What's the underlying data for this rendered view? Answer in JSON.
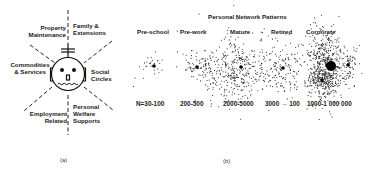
{
  "panel_a": {
    "caption": "(a)",
    "sectors": {
      "property": "Property Maintenance",
      "family": "Family & Extensions",
      "commodities": "Commodities & Services",
      "social": "Social Circles",
      "employment": "Employment Related",
      "welfare": "Personal Welfare Supports"
    },
    "center_icon": "person-face-icon"
  },
  "panel_b": {
    "caption": "(b)",
    "title": "Personal Network Patterns",
    "patterns": [
      {
        "label": "Pre-school",
        "range": "N=30-100"
      },
      {
        "label": "Pre-work",
        "range": "200-500"
      },
      {
        "label": "Mature",
        "range": "2000-5000"
      },
      {
        "label": "Retired",
        "range": "3000 → 100"
      },
      {
        "label": "Corporate",
        "range": "1000-1 000 000"
      }
    ]
  }
}
